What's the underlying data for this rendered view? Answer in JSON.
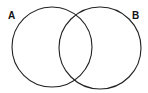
{
  "diagram": {
    "type": "venn",
    "sets": [
      {
        "id": "A",
        "label": "A",
        "cx": 52,
        "cy": 47,
        "r": 40
      },
      {
        "id": "B",
        "label": "B",
        "cx": 100,
        "cy": 48,
        "r": 41
      }
    ],
    "stroke_color": "#222222",
    "background": "#ffffff"
  }
}
